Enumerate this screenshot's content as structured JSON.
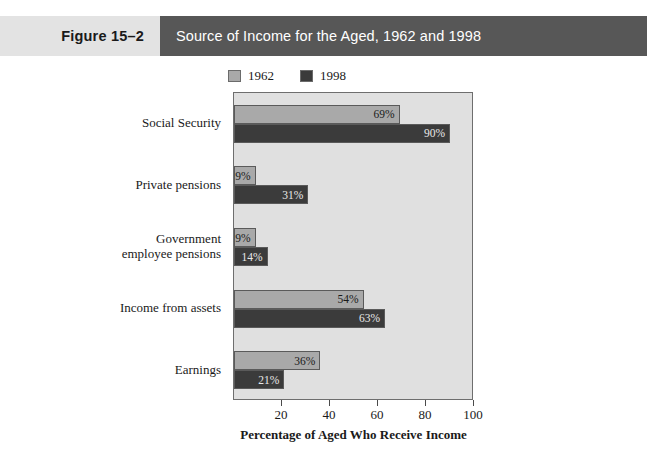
{
  "header": {
    "figure_number": "Figure 15–2",
    "title": "Source of Income for the Aged, 1962 and 1998",
    "band_light_color": "#e3e3e3",
    "band_dark_color": "#575757",
    "title_text_color": "#ffffff"
  },
  "legend": {
    "position": "top-left",
    "entries": [
      {
        "label": "1962",
        "color": "#a9a9a9"
      },
      {
        "label": "1998",
        "color": "#3b3b3b"
      }
    ]
  },
  "chart_data": {
    "type": "bar",
    "orientation": "horizontal",
    "title": "Source of Income for the Aged, 1962 and 1998",
    "xlabel": "Percentage of Aged Who Receive Income",
    "ylabel": "",
    "xlim": [
      0,
      100
    ],
    "xticks": [
      20,
      40,
      60,
      80,
      100
    ],
    "xtick_labels": [
      "20",
      "40",
      "60",
      "80",
      "100"
    ],
    "grid": false,
    "plot_background": "#e0e0e0",
    "categories": [
      "Social Security",
      "Private pensions",
      "Government\nemployee pensions",
      "Income from assets",
      "Earnings"
    ],
    "category_lines": [
      [
        "Social Security"
      ],
      [
        "Private pensions"
      ],
      [
        "Government",
        "employee pensions"
      ],
      [
        "Income from assets"
      ],
      [
        "Earnings"
      ]
    ],
    "series": [
      {
        "name": "1962",
        "color": "#a9a9a9",
        "values": [
          69,
          9,
          9,
          54,
          36
        ],
        "data_labels": [
          "69%",
          "9%",
          "9%",
          "54%",
          "36%"
        ]
      },
      {
        "name": "1998",
        "color": "#3b3b3b",
        "values": [
          90,
          31,
          14,
          63,
          21
        ],
        "data_labels": [
          "90%",
          "31%",
          "14%",
          "63%",
          "21%"
        ]
      }
    ]
  }
}
